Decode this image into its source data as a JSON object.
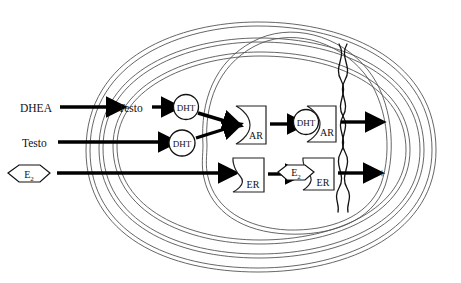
{
  "diagram": {
    "colors": {
      "membrane_stroke": "#555555",
      "arrow_fill": "#000000",
      "box_stroke": "#222222",
      "text": "#111111",
      "dna_stroke": "#111111",
      "sign_color": "#555555"
    },
    "ligands": {
      "dhea_label": "DHEA",
      "testo_outer_label": "Testo",
      "testo_inner_label": "Testo",
      "e2_outer_label": "E",
      "e2_outer_sub": "2",
      "dht_converted_label": "DHT",
      "dht_imported_label": "DHT",
      "dht_bound_label": "DHT",
      "e2_bound_label": "E",
      "e2_bound_sub": "2"
    },
    "receptors": {
      "ar_free_label": "AR",
      "er_free_label": "ER",
      "ar_bound_label": "AR",
      "er_bound_label": "ER"
    },
    "outputs": {
      "negative_sign": "−",
      "positive_sign": "+"
    }
  }
}
